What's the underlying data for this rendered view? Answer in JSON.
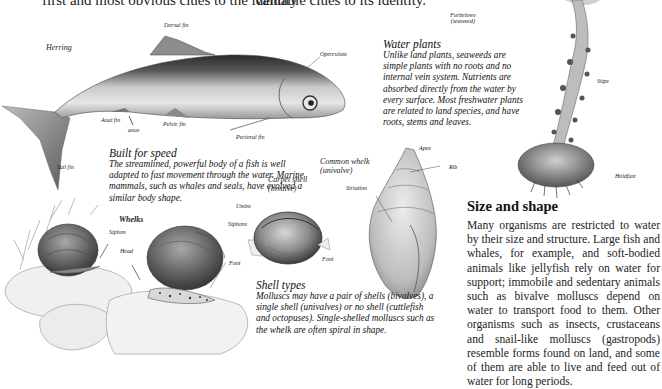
{
  "top_text": {
    "left": "first and most obvious clues to the identity",
    "right": "valuable clues to its identity."
  },
  "herring": {
    "name_label": "Herring",
    "labels": {
      "dorsal_fin": "Dorsal fin",
      "operculum": "Operculum",
      "anal_fin": "Anal fin",
      "anus": "anus",
      "pelvic_fin": "Pelvic fin",
      "pectoral_fin": "Pectoral fin",
      "tail_fin": "Tail fin"
    }
  },
  "built_for_speed": {
    "title": "Built for speed",
    "body": "The streamlined, powerful body of a fish is well adapted to fast movement through the water. Marine mammals, such as whales and seals, have evolved a similar body shape."
  },
  "water_plants": {
    "title": "Water plants",
    "body": "Unlike land plants, seaweeds are simple plants with no roots and no internal vein system. Nutrients are absorbed directly from the water by every surface. Most freshwater plants are related to land species, and have roots, stems and leaves."
  },
  "seaweed": {
    "name_line1": "Furbelows",
    "name_line2": "(seaweed)",
    "labels": {
      "stipe": "Stipe",
      "holdfast": "Holdfast"
    }
  },
  "whelks": {
    "name_label": "Whelks",
    "labels": {
      "siphon": "Siphon",
      "head": "Head",
      "foot": "Foot"
    }
  },
  "carpet_shell": {
    "name_line1": "Carpet shell",
    "name_line2": "(bivalve)",
    "labels": {
      "umbo": "Umbo",
      "siphons": "Siphons",
      "foot": "Foot"
    }
  },
  "common_whelk": {
    "name_line1": "Common whelk",
    "name_line2": "(univalve)",
    "labels": {
      "apex": "Apex",
      "rib": "Rib",
      "striation": "Striation"
    }
  },
  "shell_types": {
    "title": "Shell types",
    "body": "Molluscs may have a pair of shells (bivalves), a single shell (univalves) or no shell (cuttlefish and octopuses). Single-shelled molluscs such as the whelk are often spiral in shape."
  },
  "size_and_shape": {
    "title": "Size and shape",
    "body": "Many organisms are restricted to water by their size and structure. Large fish and whales, for example, and soft-bodied animals like jellyfish rely on water for support; immobile and sedentary animals such as bivalve molluscs depend on water to transport food to them. Other organisms such as insects, crustaceans and snail-like molluscs (gastropods) resemble forms found on land, and some of them are able to live and feed out of water for long periods."
  }
}
